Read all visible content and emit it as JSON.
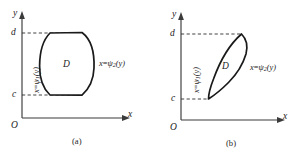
{
  "figure": {
    "panels": [
      {
        "id": "a",
        "caption": "(a)",
        "axes": {
          "y_label": "y",
          "x_label": "x",
          "origin_label": "O",
          "tick_top": "d",
          "tick_bottom": "c"
        },
        "region_label": "D",
        "left_curve": {
          "lhs": "x",
          "eq": "=",
          "psi": "ψ",
          "sub": "1",
          "arg": "(y)"
        },
        "right_curve": {
          "lhs": "x",
          "eq": "=",
          "psi": "ψ",
          "sub": "2",
          "arg": "(y)"
        },
        "shape": "barrel",
        "path": "M 50 33 L 82 32.5 C 92 40 94.5 55 94 68 C 93.6 80 90 88 82 95.2 L 50 95 C 42.5 88 39.5 78 39.6 66 C 39.7 52 43 40 50 33 Z"
      },
      {
        "id": "b",
        "caption": "(b)",
        "axes": {
          "y_label": "y",
          "x_label": "x",
          "origin_label": "O",
          "tick_top": "d",
          "tick_bottom": "c"
        },
        "region_label": "D",
        "left_curve": {
          "lhs": "x",
          "eq": "=",
          "psi": "ψ",
          "sub": "1",
          "arg": "(y)"
        },
        "right_curve": {
          "lhs": "x",
          "eq": "=",
          "psi": "ψ",
          "sub": "2",
          "arg": "(y)"
        },
        "shape": "lens",
        "path": "M 90.5 34 C 79 44 69 61 62.5 79 C 59 88 57.5 94 57.5 99 C 63 95.5 70 90 77.5 82.5 C 86 74 92 64 95 54 C 96.5 48 96.5 40 90.5 34 Z"
      }
    ],
    "colors": {
      "axis": "#3b3b3b",
      "curve": "#1a1a1a",
      "dashed": "#2e2e2e",
      "text": "#232323",
      "background": "#ffffff"
    }
  }
}
